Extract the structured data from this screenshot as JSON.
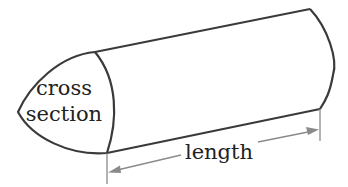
{
  "diagram": {
    "labels": {
      "cross_line1": "cross",
      "cross_line2": "section",
      "length": "length"
    },
    "colors": {
      "outline": "#3a3a3a",
      "dimension": "#8a8a8a",
      "text": "#222222",
      "background": "#ffffff"
    }
  }
}
